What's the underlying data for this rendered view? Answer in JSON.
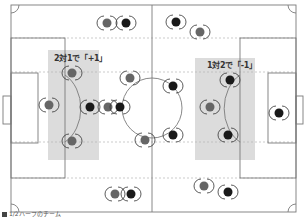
{
  "labels": {
    "left_zone": "2対1で「+1」",
    "right_zone": "1対2で「-1」"
  },
  "caption": "1/2ハーフのチーム",
  "colors": {
    "line": "#7a7a7a",
    "zone": "#d9d9d9",
    "team_gray": "#666666",
    "team_black": "#1a1a1a",
    "dotted": "#b0b0b0"
  },
  "players": [
    {
      "x": 107,
      "y": 23,
      "team": "gray"
    },
    {
      "x": 126,
      "y": 23,
      "team": "black"
    },
    {
      "x": 49,
      "y": 105,
      "team": "gray"
    },
    {
      "x": 72,
      "y": 73,
      "team": "gray"
    },
    {
      "x": 90,
      "y": 107,
      "team": "black"
    },
    {
      "x": 108,
      "y": 107,
      "team": "gray"
    },
    {
      "x": 120,
      "y": 107,
      "team": "black"
    },
    {
      "x": 130,
      "y": 78,
      "team": "gray"
    },
    {
      "x": 72,
      "y": 141,
      "team": "gray"
    },
    {
      "x": 145,
      "y": 140,
      "team": "gray"
    },
    {
      "x": 115,
      "y": 194,
      "team": "gray"
    },
    {
      "x": 131,
      "y": 194,
      "team": "black"
    },
    {
      "x": 176,
      "y": 22,
      "team": "black"
    },
    {
      "x": 200,
      "y": 32,
      "team": "gray"
    },
    {
      "x": 173,
      "y": 86,
      "team": "black"
    },
    {
      "x": 173,
      "y": 135,
      "team": "black"
    },
    {
      "x": 230,
      "y": 80,
      "team": "black"
    },
    {
      "x": 210,
      "y": 107,
      "team": "gray"
    },
    {
      "x": 228,
      "y": 135,
      "team": "black"
    },
    {
      "x": 279,
      "y": 113,
      "team": "black"
    },
    {
      "x": 204,
      "y": 186,
      "team": "gray"
    },
    {
      "x": 228,
      "y": 192,
      "team": "black"
    }
  ]
}
